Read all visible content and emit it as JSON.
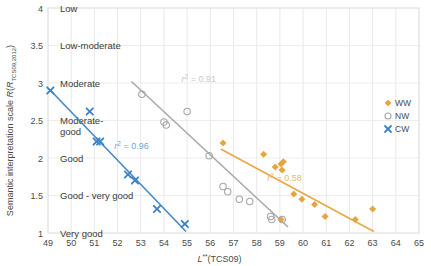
{
  "chart_data": {
    "type": "scatter",
    "title": "",
    "xlabel": "L**(TCS09)",
    "ylabel": "Semantic interpretation scale R(R_TCS09,2012)",
    "ylabel_parts": {
      "prefix": "Semantic interpretation scale ",
      "italic1": "R",
      "paren_open": "(",
      "italic2": "R",
      "subscript": "TCS09,2012",
      "paren_close": ")"
    },
    "xlabel_parts": {
      "italic": "L",
      "superscript": "**",
      "rest": "(TCS09)"
    },
    "xlim": [
      49,
      65
    ],
    "ylim": [
      1,
      4
    ],
    "xticks": [
      49,
      50,
      51,
      52,
      53,
      54,
      55,
      56,
      57,
      58,
      59,
      60,
      61,
      62,
      63,
      64,
      65
    ],
    "yticks": [
      1,
      1.5,
      2,
      2.5,
      3,
      3.5,
      4
    ],
    "ytick_labels": [
      "1",
      "1.5",
      "2",
      "2.5",
      "3",
      "3.5",
      "4"
    ],
    "y_category_labels": [
      {
        "value": 4,
        "text": "Low"
      },
      {
        "value": 3.5,
        "text": "Low-moderate"
      },
      {
        "value": 3,
        "text": "Moderate"
      },
      {
        "value": 2.5,
        "text": "Moderate-\ngood"
      },
      {
        "value": 2,
        "text": "Good"
      },
      {
        "value": 1.5,
        "text": "Good - very good"
      },
      {
        "value": 1,
        "text": "Very good"
      }
    ],
    "grid": true,
    "legend_position": "upper-right-outside",
    "series": [
      {
        "name": "WW",
        "marker": "diamond",
        "color": "#e8a33d",
        "r2": 0.58,
        "r2_label": "r² = 0.58",
        "points": [
          [
            56.55,
            2.2
          ],
          [
            58.3,
            2.05
          ],
          [
            58.8,
            1.88
          ],
          [
            59.05,
            1.92
          ],
          [
            59.1,
            1.84
          ],
          [
            59.15,
            1.95
          ],
          [
            59.6,
            1.52
          ],
          [
            59.95,
            1.45
          ],
          [
            60.5,
            1.38
          ],
          [
            60.95,
            1.22
          ],
          [
            62.25,
            1.18
          ],
          [
            63.0,
            1.32
          ],
          [
            59.05,
            1.18
          ]
        ],
        "trend": [
          [
            56.45,
            2.12
          ],
          [
            63.05,
            1.02
          ]
        ]
      },
      {
        "name": "NW",
        "marker": "circle-open",
        "color": "#a6a6a6",
        "r2": 0.91,
        "r2_label": "r² = 0.91",
        "points": [
          [
            53.05,
            2.85
          ],
          [
            55.0,
            2.62
          ],
          [
            54.0,
            2.48
          ],
          [
            54.1,
            2.44
          ],
          [
            55.95,
            2.03
          ],
          [
            56.55,
            1.62
          ],
          [
            56.75,
            1.55
          ],
          [
            57.25,
            1.45
          ],
          [
            57.7,
            1.42
          ],
          [
            58.6,
            1.22
          ],
          [
            58.65,
            1.18
          ],
          [
            59.1,
            1.18
          ]
        ],
        "trend": [
          [
            52.6,
            3.02
          ],
          [
            59.35,
            1.08
          ]
        ]
      },
      {
        "name": "CW",
        "marker": "x",
        "color": "#3b83c4",
        "r2": 0.96,
        "r2_label": "r² = 0.96",
        "points": [
          [
            49.1,
            2.9
          ],
          [
            50.8,
            2.62
          ],
          [
            51.1,
            2.22
          ],
          [
            51.25,
            2.22
          ],
          [
            52.45,
            1.78
          ],
          [
            52.75,
            1.7
          ],
          [
            53.7,
            1.32
          ],
          [
            54.9,
            1.12
          ]
        ],
        "trend": [
          [
            49.05,
            2.92
          ],
          [
            54.95,
            1.02
          ]
        ]
      }
    ],
    "annotations": [
      {
        "text": "r² = 0.91",
        "x": 55.5,
        "y": 3.02,
        "color": "#c9c9c9"
      },
      {
        "text": "r² = 0.96",
        "x": 52.6,
        "y": 2.12,
        "color": "#6aa8dd"
      },
      {
        "text": "r² = 0.58",
        "x": 59.2,
        "y": 1.7,
        "color": "#e9b96a"
      }
    ]
  },
  "legend": {
    "items": [
      {
        "label": "WW",
        "marker": "diamond",
        "color": "#e8a33d"
      },
      {
        "label": "NW",
        "marker": "circle-open",
        "color": "#a6a6a6"
      },
      {
        "label": "CW",
        "marker": "x",
        "color": "#3b83c4"
      }
    ]
  }
}
